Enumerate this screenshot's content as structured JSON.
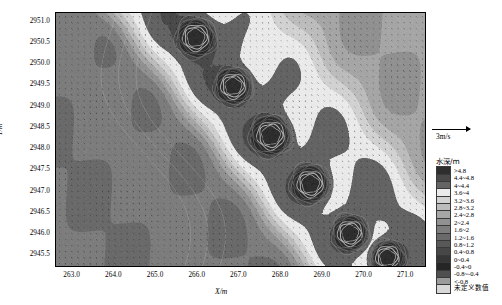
{
  "chart_data": {
    "type": "heatmap",
    "title": "",
    "xlabel": "X/m",
    "ylabel": "Y/m",
    "xlim": [
      262.6,
      271.45
    ],
    "ylim": [
      2945.25,
      2951.2
    ],
    "xticks": [
      "263.0",
      "264.0",
      "265.0",
      "266.0",
      "267.0",
      "268.0",
      "269.0",
      "270.0",
      "271.0"
    ],
    "xtick_values": [
      263.0,
      264.0,
      265.0,
      266.0,
      267.0,
      268.0,
      269.0,
      270.0,
      271.0
    ],
    "yticks": [
      "2951.0",
      "2950.5",
      "2950.0",
      "2949.5",
      "2949.0",
      "2948.5",
      "2948.0",
      "2947.5",
      "2947.0",
      "2946.5",
      "2946.0",
      "2945.5"
    ],
    "ytick_values": [
      2951.0,
      2950.5,
      2950.0,
      2949.5,
      2949.0,
      2948.5,
      2948.0,
      2947.5,
      2947.0,
      2946.5,
      2946.0,
      2945.5
    ],
    "grid": false,
    "colormap": "grayscale",
    "overlay": "velocity-vector-field",
    "features": [
      {
        "name": "scour-hole-1",
        "x": 265.95,
        "y": 2950.62,
        "radius_m": 0.38,
        "depth_class": ">4.8"
      },
      {
        "name": "scour-hole-2",
        "x": 266.85,
        "y": 2949.48,
        "radius_m": 0.36,
        "depth_class": ">4.8"
      },
      {
        "name": "scour-hole-3",
        "x": 267.75,
        "y": 2948.32,
        "radius_m": 0.4,
        "depth_class": ">4.8"
      },
      {
        "name": "scour-hole-4",
        "x": 268.7,
        "y": 2947.18,
        "radius_m": 0.38,
        "depth_class": ">4.8"
      },
      {
        "name": "scour-hole-5",
        "x": 269.65,
        "y": 2946.02,
        "radius_m": 0.36,
        "depth_class": ">4.8"
      },
      {
        "name": "scour-hole-6",
        "x": 270.55,
        "y": 2945.45,
        "radius_m": 0.34,
        "depth_class": ">4.8"
      }
    ],
    "legend_title": "水深/m",
    "legend_entries": [
      {
        "label": ">4.8",
        "color": "#2e2e2e",
        "min": 4.8,
        "max": null
      },
      {
        "label": "4.4~4.8",
        "color": "#4a4a4a",
        "min": 4.4,
        "max": 4.8
      },
      {
        "label": "4~4.4",
        "color": "#646464",
        "min": 4.0,
        "max": 4.4
      },
      {
        "label": "3.6~4",
        "color": "#eaeaea",
        "min": 3.6,
        "max": 4.0
      },
      {
        "label": "3.2~3.6",
        "color": "#d2d2d2",
        "min": 3.2,
        "max": 3.6
      },
      {
        "label": "2.8~3.2",
        "color": "#bcbcbc",
        "min": 2.8,
        "max": 3.2
      },
      {
        "label": "2.4~2.8",
        "color": "#a6a6a6",
        "min": 2.4,
        "max": 2.8
      },
      {
        "label": "2~2.4",
        "color": "#919191",
        "min": 2.0,
        "max": 2.4
      },
      {
        "label": "1.6~2",
        "color": "#7d7d7d",
        "min": 1.6,
        "max": 2.0
      },
      {
        "label": "1.2~1.6",
        "color": "#6a6a6a",
        "min": 1.2,
        "max": 1.6
      },
      {
        "label": "0.8~1.2",
        "color": "#585858",
        "min": 0.8,
        "max": 1.2
      },
      {
        "label": "0.4~0.8",
        "color": "#474747",
        "min": 0.4,
        "max": 0.8
      },
      {
        "label": "0~0.4",
        "color": "#363636",
        "min": 0.0,
        "max": 0.4
      },
      {
        "label": "-0.4~0",
        "color": "#262626",
        "min": -0.4,
        "max": 0.0
      },
      {
        "label": "-0.8~-0.4",
        "color": "#4f4f4f",
        "min": -0.8,
        "max": -0.4
      },
      {
        "label": "<-0.8",
        "color": "#9b9b9b",
        "min": null,
        "max": -0.8
      },
      {
        "label": "未定义数值",
        "color": "#d8d8d8",
        "min": null,
        "max": null
      }
    ]
  },
  "velocity_scale": {
    "label": "3m/s",
    "magnitude": 3,
    "unit": "m/s"
  }
}
